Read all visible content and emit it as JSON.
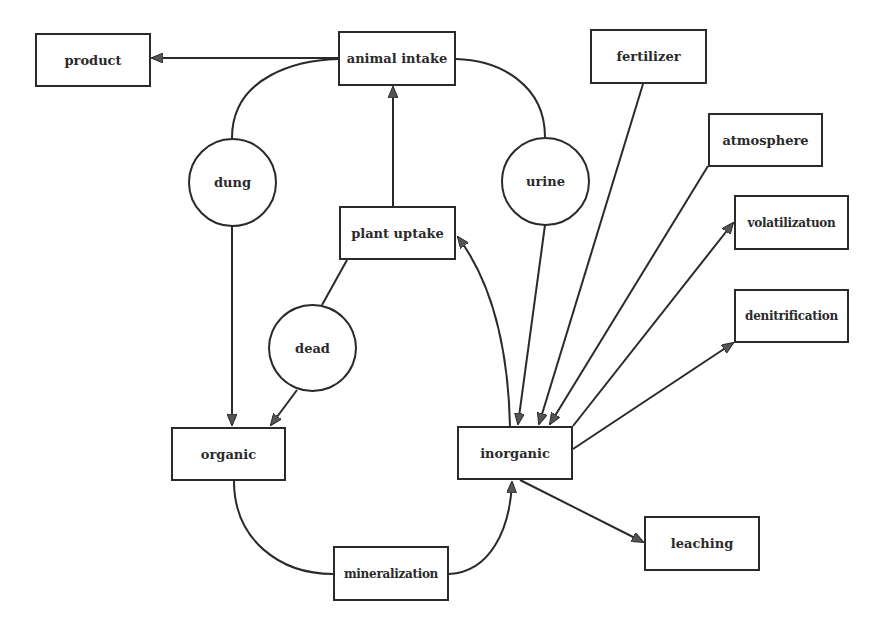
{
  "diagram": {
    "title": "",
    "colors": {
      "stroke": "#2a2a2a",
      "arrowhead": "#555555",
      "background": "#ffffff"
    },
    "nodes": {
      "product": {
        "label": "product",
        "shape": "box"
      },
      "animal_intake": {
        "label": "animal intake",
        "shape": "box"
      },
      "fertilizer": {
        "label": "fertilizer",
        "shape": "box"
      },
      "atmosphere": {
        "label": "atmosphere",
        "shape": "box"
      },
      "volatilization": {
        "label": "volatilizatuon",
        "shape": "box"
      },
      "denitrification": {
        "label": "denitrification",
        "shape": "box"
      },
      "plant_uptake": {
        "label": "plant uptake",
        "shape": "box"
      },
      "dung": {
        "label": "dung",
        "shape": "circle"
      },
      "urine": {
        "label": "urine",
        "shape": "circle"
      },
      "dead": {
        "label": "dead",
        "shape": "circle"
      },
      "organic": {
        "label": "organic",
        "shape": "box"
      },
      "inorganic": {
        "label": "inorganic",
        "shape": "box"
      },
      "mineralization": {
        "label": "mineralization",
        "shape": "box"
      },
      "leaching": {
        "label": "leaching",
        "shape": "box"
      }
    },
    "edges": [
      {
        "from": "animal intake",
        "to": "product"
      },
      {
        "from": "animal intake",
        "to": "organic",
        "via": "dung"
      },
      {
        "from": "animal intake",
        "to": "inorganic",
        "via": "urine"
      },
      {
        "from": "plant uptake",
        "to": "animal intake"
      },
      {
        "from": "plant uptake",
        "to": "organic",
        "via": "dead"
      },
      {
        "from": "inorganic",
        "to": "plant uptake"
      },
      {
        "from": "fertilizer",
        "to": "inorganic"
      },
      {
        "from": "atmosphere",
        "to": "inorganic"
      },
      {
        "from": "inorganic",
        "to": "volatilizatuon"
      },
      {
        "from": "inorganic",
        "to": "denitrification"
      },
      {
        "from": "inorganic",
        "to": "leaching"
      },
      {
        "from": "organic",
        "to": "inorganic",
        "via": "mineralization"
      }
    ]
  }
}
